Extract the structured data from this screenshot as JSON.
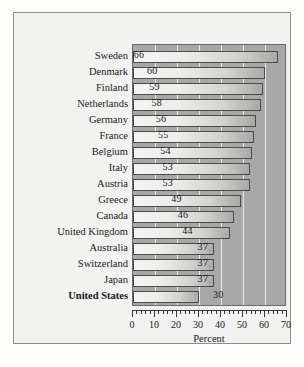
{
  "chart_data": {
    "type": "bar",
    "orientation": "horizontal",
    "title": "",
    "xlabel": "Percent",
    "ylabel": "",
    "xlim": [
      0,
      70
    ],
    "xticks": [
      0,
      10,
      20,
      30,
      40,
      50,
      60,
      70
    ],
    "xtick_labels": [
      "0",
      "10",
      "20",
      "30",
      "40",
      "50",
      "60",
      "70"
    ],
    "minor_tick_step": 2,
    "grid": "vertical-white-gridlines",
    "legend": "none",
    "value_labels_shown": true,
    "categories": [
      "Sweden",
      "Denmark",
      "Finland",
      "Netherlands",
      "Germany",
      "France",
      "Belgium",
      "Italy",
      "Austria",
      "Greece",
      "Canada",
      "United Kingdom",
      "Australia",
      "Switzerland",
      "Japan",
      "United States"
    ],
    "values": [
      66,
      60,
      59,
      58,
      56,
      55,
      54,
      53,
      53,
      49,
      46,
      44,
      37,
      37,
      37,
      30
    ],
    "emphasized_category": "United States",
    "colors": {
      "plot_background": "#a8a8a8",
      "gridline": "#e9e9e6",
      "bar_outline": "#4a4a4a",
      "bar_fill_light": "#f4f4f2",
      "bar_fill_dark": "#a9a9a6",
      "figure_background": "#f2f2f0",
      "frame_border": "#8d8d8d",
      "text": "#1a1a1a"
    }
  }
}
